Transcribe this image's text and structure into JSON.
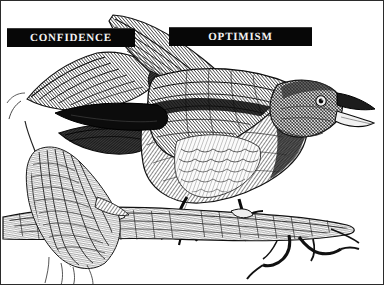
{
  "artwork": {
    "title": "Perched songbird engraving with motivational banners",
    "style": "vintage-steel-engraving",
    "subject": "bird perched on branch with raised wings and open beak",
    "background_color": "#ffffff",
    "ink_color": "#1a1a1a",
    "border_color": "#2b2b2b"
  },
  "banners": {
    "background_color": "#070707",
    "text_color": "#f2f2f2",
    "items": [
      {
        "id": "confidence",
        "label": "CONFIDENCE"
      },
      {
        "id": "optimism",
        "label": "OPTIMISM"
      }
    ]
  }
}
